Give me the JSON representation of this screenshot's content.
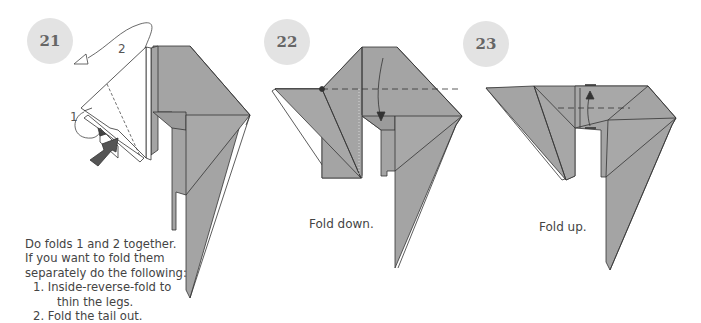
{
  "steps": [
    {
      "number": "21",
      "instructions": {
        "line1": "Do folds 1 and 2 together.",
        "line2": "If you want to fold them",
        "line3": "separately do the following:",
        "items": [
          {
            "label": "1. Inside-reverse-fold to",
            "cont": "thin the legs."
          },
          {
            "label": "2. Fold the tail out."
          }
        ]
      },
      "fold_labels": {
        "fold1": "1",
        "fold2": "2"
      }
    },
    {
      "number": "22",
      "caption": "Fold down."
    },
    {
      "number": "23",
      "caption": "Fold up."
    }
  ],
  "colors": {
    "paper": "#a4a4a4",
    "badge": "#e3e3e3",
    "text": "#444444"
  }
}
